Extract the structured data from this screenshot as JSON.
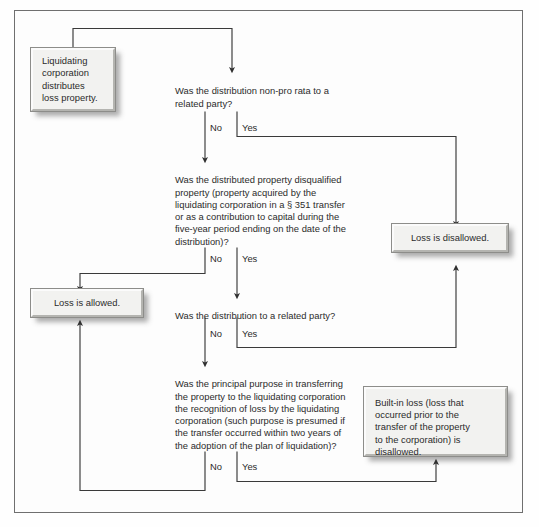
{
  "diagram": {
    "frame_border_color": "#6f6f6f",
    "box_fill_color": "#f2f2f0",
    "text_color": "#2b2b2b",
    "line_color": "#3a3a3a"
  },
  "boxes": {
    "start": "Liquidating\ncorporation\ndistributes\nloss property.",
    "loss_disallowed": "Loss is disallowed.",
    "loss_allowed": "Loss is allowed.",
    "built_in_loss": "Built-in loss (loss that\noccurred prior to the\ntransfer of the property\nto the corporation) is\ndisallowed."
  },
  "questions": {
    "q1": "Was the distribution non-pro rata to a\nrelated party?",
    "q2": "Was the distributed property disqualified\nproperty (property acquired by the\nliquidating corporation in a § 351 transfer\nor as a contribution to capital during the\nfive-year period ending on the date of the\ndistribution)?",
    "q3": "Was the distribution to a related party?",
    "q4": "Was the principal purpose in transferring\nthe property to the liquidating corporation\nthe recognition of loss by the liquidating\ncorporation (such purpose is presumed if\nthe transfer occurred within two years of\nthe adoption of the plan of liquidation)?"
  },
  "labels": {
    "q1_no": "No",
    "q1_yes": "Yes",
    "q2_no": "No",
    "q2_yes": "Yes",
    "q3_no": "No",
    "q3_yes": "Yes",
    "q4_no": "No",
    "q4_yes": "Yes"
  }
}
